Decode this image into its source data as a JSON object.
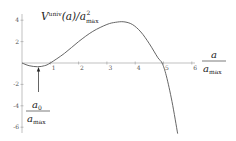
{
  "chart_data": {
    "type": "line",
    "title": "",
    "ylabel": "V^univ(a)/a_max^2",
    "ylabel_parts": {
      "main": "V",
      "sup": "univ",
      "arg": "(a)/a",
      "sub": "max",
      "sup2": "2"
    },
    "xlabel": "a / a_max",
    "xlabel_parts": {
      "num": "a",
      "den_main": "a",
      "den_sub": "max"
    },
    "annotation": {
      "text": "a_0 / a_max",
      "num_main": "a",
      "num_sub": "0",
      "den_main": "a",
      "den_sub": "max",
      "x": 0.55,
      "arrow": true
    },
    "x_ticks": [
      "1",
      "2",
      "3",
      "4",
      "5",
      "6"
    ],
    "y_ticks": [
      "4",
      "2",
      "-2",
      "-4",
      "-6"
    ],
    "xlim": [
      0,
      6.3
    ],
    "ylim": [
      -6.8,
      4.5
    ],
    "grid": false,
    "series": [
      {
        "name": "V_univ",
        "x": [
          0,
          0.25,
          0.55,
          0.8,
          1.0,
          1.5,
          2.0,
          2.5,
          3.0,
          3.3,
          3.6,
          3.9,
          4.2,
          4.5,
          4.8,
          4.95,
          5.1,
          5.3,
          5.5
        ],
        "y": [
          0,
          -0.25,
          -0.35,
          -0.25,
          0,
          0.9,
          2.0,
          2.95,
          3.6,
          3.8,
          3.85,
          3.6,
          2.9,
          1.8,
          0.5,
          0,
          -1.2,
          -3.6,
          -6.6
        ]
      }
    ],
    "color": "#555555"
  }
}
